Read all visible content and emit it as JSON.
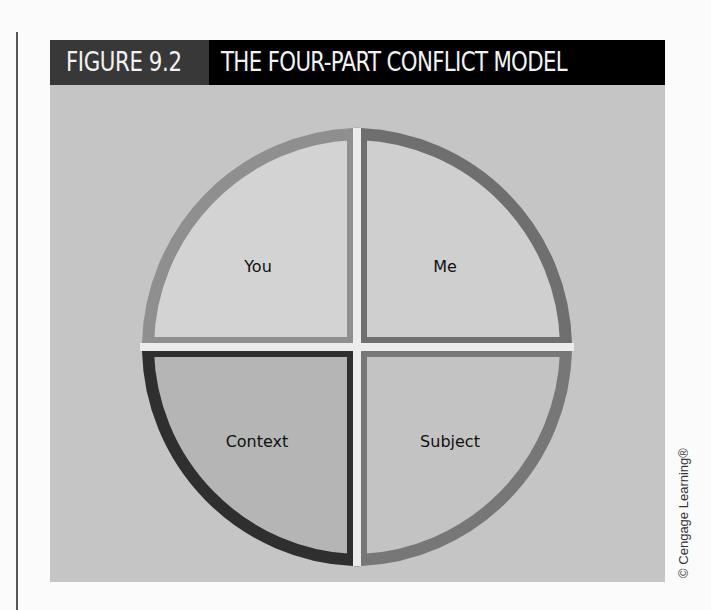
{
  "figure": {
    "number": "FIGURE 9.2",
    "title": "THE FOUR-PART CONFLICT MODEL"
  },
  "diagram": {
    "type": "four-quadrant circle",
    "center": [
      357,
      347
    ],
    "radius": 215,
    "quadrants": [
      {
        "position": "top-left",
        "label": "You",
        "fill": "#d3d3d3",
        "border": "#8f8f8f"
      },
      {
        "position": "top-right",
        "label": "Me",
        "fill": "#cfcfcf",
        "border": "#6f6f6f"
      },
      {
        "position": "bottom-left",
        "label": "Context",
        "fill": "#b5b5b5",
        "border": "#2f2f2f"
      },
      {
        "position": "bottom-right",
        "label": "Subject",
        "fill": "#c3c3c3",
        "border": "#777777"
      }
    ]
  },
  "colors": {
    "panel_bg": "#c5c5c5",
    "title_num_bg": "#383838",
    "title_bg": "#000000",
    "title_text": "#f2f2f2"
  },
  "credit": "© Cengage Learning®"
}
